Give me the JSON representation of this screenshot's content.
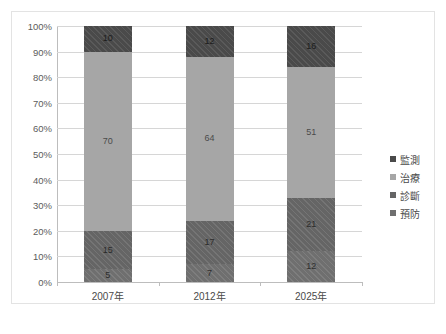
{
  "chart_data": {
    "type": "bar",
    "subtype": "100% stacked column",
    "title": "",
    "xlabel": "",
    "ylabel": "",
    "categories": [
      "2007年",
      "2012年",
      "2025年"
    ],
    "series": [
      {
        "name": "預防",
        "values": [
          5,
          15,
          12
        ],
        "color": "#6f6f6f"
      },
      {
        "name": "診斷",
        "values": [
          15,
          17,
          21
        ],
        "color": "#656565"
      },
      {
        "name": "治療",
        "values": [
          70,
          64,
          51
        ],
        "color": "#a6a6a6"
      },
      {
        "name": "監測",
        "values": [
          10,
          12,
          16
        ],
        "color": "#4a4a4a"
      }
    ],
    "stack_order_bottom_to_top": [
      "預防",
      "診斷",
      "治療",
      "監測"
    ],
    "ylim": [
      0,
      100
    ],
    "ytick_labels": [
      "100%",
      "90%",
      "80%",
      "70%",
      "60%",
      "50%",
      "40%",
      "30%",
      "20%",
      "10%",
      "0%"
    ],
    "ytick_values": [
      100,
      90,
      80,
      70,
      60,
      50,
      40,
      30,
      20,
      10,
      0
    ],
    "grid": true,
    "grid_axis": "y",
    "legend_position": "right",
    "legend_order_top_to_bottom": [
      "監測",
      "治療",
      "診斷",
      "預防"
    ],
    "data_labels_shown": true,
    "bars": [
      {
        "category": "2007年",
        "segments": [
          {
            "name": "預防",
            "value": 5,
            "label": "5",
            "from": 0,
            "to": 5
          },
          {
            "name": "診斷",
            "value": 15,
            "label": "15",
            "from": 5,
            "to": 20
          },
          {
            "name": "治療",
            "value": 70,
            "label": "70",
            "from": 20,
            "to": 90
          },
          {
            "name": "監測",
            "value": 10,
            "label": "10",
            "from": 90,
            "to": 100
          }
        ]
      },
      {
        "category": "2012年",
        "segments": [
          {
            "name": "預防",
            "value": 7,
            "label": "7",
            "from": 0,
            "to": 7
          },
          {
            "name": "診斷",
            "value": 17,
            "label": "17",
            "from": 7,
            "to": 24
          },
          {
            "name": "治療",
            "value": 64,
            "label": "64",
            "from": 24,
            "to": 88
          },
          {
            "name": "監測",
            "value": 12,
            "label": "12",
            "from": 88,
            "to": 100
          }
        ]
      },
      {
        "category": "2025年",
        "segments": [
          {
            "name": "預防",
            "value": 12,
            "label": "12",
            "from": 0,
            "to": 12
          },
          {
            "name": "診斷",
            "value": 21,
            "label": "21",
            "from": 12,
            "to": 33
          },
          {
            "name": "治療",
            "value": 51,
            "label": "51",
            "from": 33,
            "to": 84
          },
          {
            "name": "監測",
            "value": 16,
            "label": "16",
            "from": 84,
            "to": 100
          }
        ]
      }
    ]
  },
  "legend": {
    "entries": [
      {
        "label": "監測",
        "color": "#4a4a4a"
      },
      {
        "label": "治療",
        "color": "#a6a6a6"
      },
      {
        "label": "診斷",
        "color": "#656565"
      },
      {
        "label": "預防",
        "color": "#6f6f6f"
      }
    ]
  },
  "caption": {
    "text": ""
  }
}
